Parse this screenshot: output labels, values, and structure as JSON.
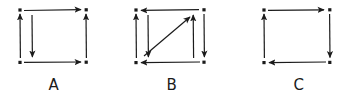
{
  "figure": {
    "background": "#ffffff",
    "ink_color": "#1b1b1b",
    "style": "hand-drawn-sketch",
    "diagram_count": 3
  },
  "diagrams": [
    {
      "id": "diagram-a",
      "label": "A",
      "node_count": 4,
      "nodes": [
        {
          "name": "top-left",
          "x": 12,
          "y": 10
        },
        {
          "name": "top-right",
          "x": 78,
          "y": 10
        },
        {
          "name": "bottom-left",
          "x": 12,
          "y": 62
        },
        {
          "name": "bottom-right",
          "x": 78,
          "y": 62
        }
      ],
      "edges": [
        {
          "name": "edge-top",
          "from": "top-left",
          "to": "top-right",
          "direction": "right",
          "style": "straight"
        },
        {
          "name": "edge-left-outer",
          "from": "bottom-left",
          "to": "top-left",
          "direction": "up",
          "style": "straight"
        },
        {
          "name": "edge-left-inner",
          "from": "top-left",
          "to": "bottom-left",
          "direction": "down",
          "style": "straight"
        },
        {
          "name": "edge-right",
          "from": "bottom-right",
          "to": "top-right",
          "direction": "up",
          "style": "straight"
        },
        {
          "name": "edge-bottom",
          "from": "bottom-left",
          "to": "bottom-right",
          "direction": "right",
          "style": "straight"
        }
      ],
      "edge_count": 5,
      "has_diagonal": false
    },
    {
      "id": "diagram-b",
      "label": "B",
      "node_count": 4,
      "nodes": [
        {
          "name": "top-left",
          "x": 12,
          "y": 10
        },
        {
          "name": "top-right",
          "x": 80,
          "y": 10
        },
        {
          "name": "bottom-left",
          "x": 12,
          "y": 62
        },
        {
          "name": "bottom-right",
          "x": 80,
          "y": 62
        }
      ],
      "edges": [
        {
          "name": "edge-top",
          "from": "top-right",
          "to": "top-left",
          "direction": "left",
          "style": "straight"
        },
        {
          "name": "edge-left-outer",
          "from": "bottom-left",
          "to": "top-left",
          "direction": "up",
          "style": "straight"
        },
        {
          "name": "edge-left-inner",
          "from": "top-left",
          "to": "bottom-left",
          "direction": "down",
          "style": "straight"
        },
        {
          "name": "edge-right-inner",
          "from": "bottom-right",
          "to": "top-right",
          "direction": "up",
          "style": "straight"
        },
        {
          "name": "edge-right-outer",
          "from": "top-right",
          "to": "bottom-right",
          "direction": "down",
          "style": "straight"
        },
        {
          "name": "edge-bottom",
          "from": "bottom-right",
          "to": "bottom-left",
          "direction": "left",
          "style": "straight"
        },
        {
          "name": "edge-diagonal",
          "from": "bottom-left",
          "to": "top-right",
          "direction": "up-right",
          "style": "diagonal"
        }
      ],
      "edge_count": 7,
      "has_diagonal": true
    },
    {
      "id": "diagram-c",
      "label": "C",
      "node_count": 4,
      "nodes": [
        {
          "name": "top-left",
          "x": 12,
          "y": 10
        },
        {
          "name": "top-right",
          "x": 78,
          "y": 10
        },
        {
          "name": "bottom-left",
          "x": 12,
          "y": 62
        },
        {
          "name": "bottom-right",
          "x": 78,
          "y": 62
        }
      ],
      "edges": [
        {
          "name": "edge-top",
          "from": "top-left",
          "to": "top-right",
          "direction": "right",
          "style": "straight"
        },
        {
          "name": "edge-left",
          "from": "bottom-left",
          "to": "top-left",
          "direction": "up",
          "style": "straight"
        },
        {
          "name": "edge-right",
          "from": "top-right",
          "to": "bottom-right",
          "direction": "down",
          "style": "straight"
        },
        {
          "name": "edge-bottom",
          "from": "bottom-right",
          "to": "bottom-left",
          "direction": "left",
          "style": "straight"
        }
      ],
      "edge_count": 4,
      "has_diagonal": false
    }
  ]
}
